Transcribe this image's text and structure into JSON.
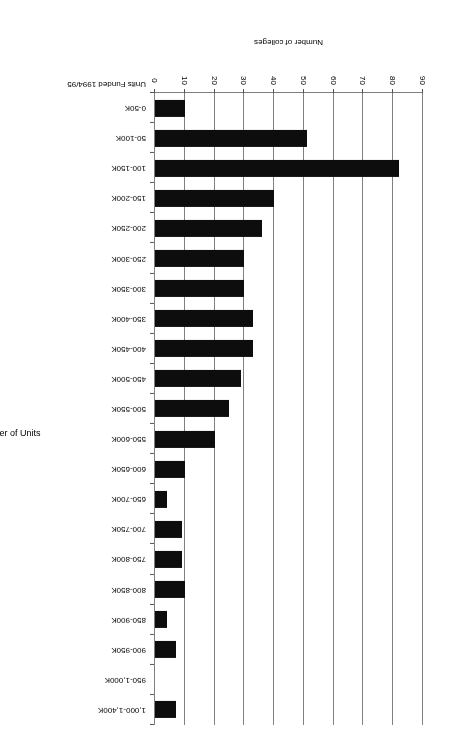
{
  "chart_data": {
    "type": "bar",
    "orientation": "horizontal",
    "title": "Number of units funded in colleges 1994/95",
    "xlabel": "Number of colleges",
    "ylabel": "Number of Units",
    "category_axis_header": "Units Funded 1994/95",
    "xlim": [
      0,
      90
    ],
    "xticks": [
      0,
      10,
      20,
      30,
      40,
      50,
      60,
      70,
      80,
      90
    ],
    "grid": true,
    "legend": false,
    "bar_color": "#0d0d0d",
    "grid_color": "#808080",
    "categories": [
      "0-50K",
      "50-100K",
      "100-150K",
      "150-200K",
      "200-250K",
      "250-300K",
      "300-350K",
      "350-400K",
      "400-450K",
      "450-500K",
      "500-550K",
      "550-600K",
      "600-650K",
      "650-700K",
      "700-750K",
      "750-800K",
      "800-850K",
      "850-900K",
      "900-950K",
      "950-1,000K",
      "1,000-1,400K"
    ],
    "values": [
      10,
      51,
      82,
      40,
      36,
      30,
      30,
      33,
      33,
      29,
      25,
      20,
      10,
      4,
      9,
      9,
      10,
      4,
      7,
      0,
      7
    ]
  }
}
